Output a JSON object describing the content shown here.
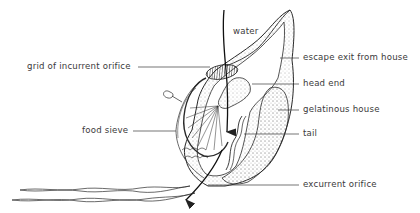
{
  "diagram": {
    "labels": {
      "water": "water",
      "grid_of_incurrent_orifice": "grid of incurrent orifice",
      "escape_exit": "escape exit from house",
      "head_end": "head end",
      "gelatinous_house": "gelatinous house",
      "food_sieve": "food sieve",
      "tail": "tail",
      "excurrent_orifice": "excurrent orifice"
    },
    "colors": {
      "line": "#2a2a2a",
      "text": "#3a3a3a",
      "background": "#ffffff"
    }
  }
}
